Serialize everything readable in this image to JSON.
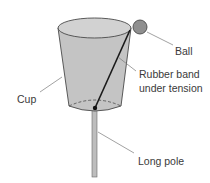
{
  "diagram": {
    "colors": {
      "cup_fill": "#c4c4c4",
      "cup_top_fill": "#d2d2d2",
      "outline": "#4a4a4a",
      "ball_fill": "#8f8f8f",
      "pole_fill": "#bdbdbd",
      "band": "#1a1a1a",
      "leader": "#7a7a7a"
    },
    "labels": {
      "ball": "Ball",
      "band_line1": "Rubber band",
      "band_line2": "under tension",
      "cup": "Cup",
      "pole": "Long pole"
    }
  }
}
